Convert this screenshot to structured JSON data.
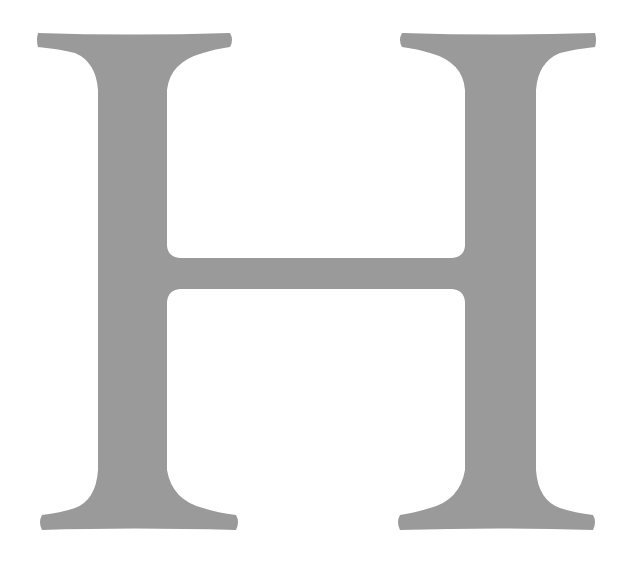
{
  "image": {
    "letter": "H",
    "style": "serif capital letter",
    "fill_color": "#9a9a9a",
    "background_color": "#ffffff"
  }
}
